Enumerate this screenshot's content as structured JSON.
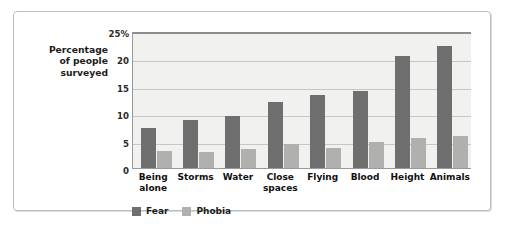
{
  "chart_data": {
    "type": "bar",
    "title": "",
    "xlabel": "",
    "ylabel": "Percentage of people surveyed",
    "ylabel_lines": [
      "Percentage",
      "of people",
      "surveyed"
    ],
    "categories": [
      "Being alone",
      "Storms",
      "Water",
      "Close spaces",
      "Flying",
      "Blood",
      "Height",
      "Animals"
    ],
    "category_lines": [
      [
        "Being",
        "alone"
      ],
      [
        "Storms"
      ],
      [
        "Water"
      ],
      [
        "Close",
        "spaces"
      ],
      [
        "Flying"
      ],
      [
        "Blood"
      ],
      [
        "Height"
      ],
      [
        "Animals"
      ]
    ],
    "series": [
      {
        "name": "Fear",
        "color": "#6f6f6f",
        "values": [
          7.3,
          8.8,
          9.5,
          12.0,
          13.3,
          14.0,
          20.5,
          22.3
        ]
      },
      {
        "name": "Phobia",
        "color": "#b0b0ae",
        "values": [
          3.1,
          2.9,
          3.5,
          4.4,
          3.6,
          4.7,
          5.4,
          5.8
        ]
      }
    ],
    "ylim": [
      0,
      25
    ],
    "yticks": [
      0,
      5,
      10,
      15,
      20,
      25
    ],
    "ytick_labels": [
      "0",
      "5",
      "10",
      "15",
      "20",
      "25%"
    ],
    "grid": true,
    "legend_position": "bottom-left",
    "plot_background": "#f1f1ef",
    "frame_color": "#b9bfc4"
  }
}
